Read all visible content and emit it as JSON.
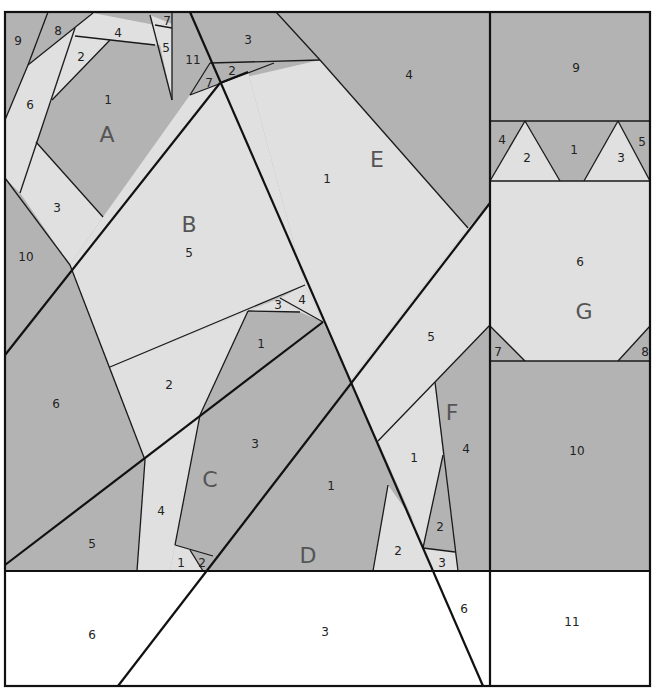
{
  "diagram": {
    "type": "paper-piecing quilt pattern",
    "colors": {
      "dark": "#b3b3b3",
      "light": "#e0e0e0",
      "white": "#ffffff",
      "line": "#111111",
      "section_label": "#555555"
    },
    "sections": {
      "A": {
        "label": "A",
        "pieces": [
          "1",
          "2",
          "3",
          "4",
          "5",
          "6",
          "7",
          "8",
          "9",
          "10",
          "11"
        ]
      },
      "B": {
        "label": "B",
        "pieces": [
          "1",
          "2",
          "3",
          "4",
          "5",
          "6",
          "7"
        ]
      },
      "C": {
        "label": "C",
        "pieces": [
          "1",
          "2",
          "3",
          "4",
          "5"
        ]
      },
      "D": {
        "label": "D",
        "pieces": [
          "1",
          "2",
          "3",
          "6"
        ]
      },
      "E": {
        "label": "E",
        "pieces": [
          "1",
          "2",
          "3",
          "4",
          "5",
          "6",
          "7"
        ]
      },
      "F": {
        "label": "F",
        "pieces": [
          "1",
          "2",
          "3",
          "4"
        ]
      },
      "G": {
        "label": "G",
        "pieces": [
          "1",
          "2",
          "3",
          "4",
          "5",
          "6",
          "7",
          "8",
          "9",
          "10",
          "11"
        ]
      }
    },
    "labels": {
      "A": "A",
      "B": "B",
      "C": "C",
      "D": "D",
      "E": "E",
      "F": "F",
      "G": "G",
      "a1": "1",
      "a2": "2",
      "a3": "3",
      "a4": "4",
      "a5": "5",
      "a6": "6",
      "a7": "7",
      "a8": "8",
      "a9": "9",
      "a10": "10",
      "a11": "11",
      "b5": "5",
      "b6": "6",
      "b2": "2",
      "b3": "3",
      "b4": "4",
      "b1": "1",
      "c3": "3",
      "c4": "4",
      "c5": "5",
      "c1": "1",
      "c2": "2",
      "d1": "1",
      "d6": "6",
      "d3": "3",
      "e3": "3",
      "e4": "4",
      "e2": "2",
      "e7": "7",
      "e1": "1",
      "e5": "5",
      "f1": "1",
      "f2": "2",
      "f3": "3",
      "f4": "4",
      "f2b": "2",
      "g9": "9",
      "g4": "4",
      "g2": "2",
      "g1": "1",
      "g3": "3",
      "g5": "5",
      "g6": "6",
      "g7": "7",
      "g8": "8",
      "g10": "10",
      "g11": "11",
      "bot6": "6",
      "bot3": "3",
      "bot6r": "6"
    }
  }
}
